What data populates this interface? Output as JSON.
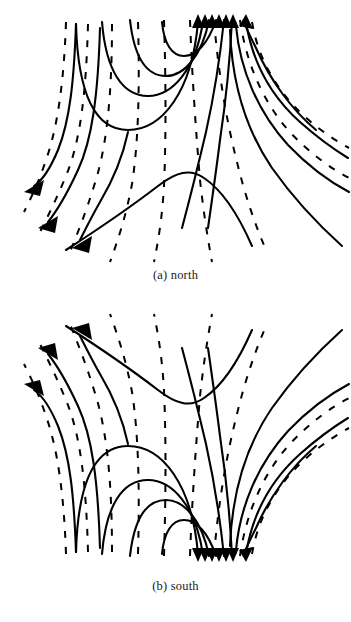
{
  "figure": {
    "background_color": "#ffffff",
    "ink_color": "#000000",
    "width": 351,
    "height": 622,
    "kind": "field-line-diagram-pair"
  },
  "panels": [
    {
      "id": "north",
      "caption": "(a) north",
      "convergence": "top-center",
      "arrow_cluster_count": 6,
      "arrow_cluster_direction": "up",
      "outflow_arrow_count": 3,
      "outflow_arrow_direction": "down-left",
      "extra_arrow_direction": "up",
      "feature_center": "arch-peak-lower-center"
    },
    {
      "id": "south",
      "caption": "(b) south",
      "convergence": "bottom-center",
      "arrow_cluster_count": 6,
      "arrow_cluster_direction": "down",
      "outflow_arrow_count": 3,
      "outflow_arrow_direction": "up-left",
      "extra_arrow_direction": "down-right",
      "feature_center": "valley-trough-upper-center"
    }
  ],
  "legend": {
    "solid_line_meaning": "solid field line",
    "dashed_line_meaning": "dashed field line"
  }
}
